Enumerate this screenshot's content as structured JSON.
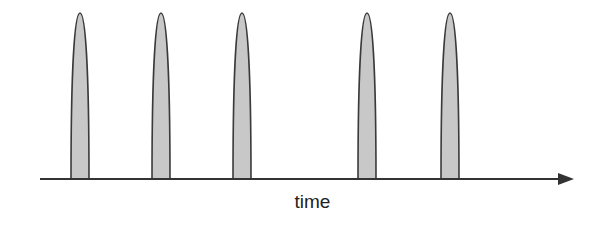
{
  "diagram": {
    "type": "spike-train",
    "axis_label": "time",
    "spike_count": 5,
    "spikes_x": [
      80,
      161,
      242,
      367,
      450
    ],
    "colors": {
      "spike_fill": "#c8c8c8",
      "stroke": "#333333"
    }
  }
}
